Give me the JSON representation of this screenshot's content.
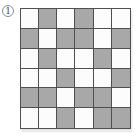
{
  "figure": {
    "option_label": "1",
    "grid": {
      "rows": 6,
      "cols": 6,
      "legend": {
        "1": "shaded",
        "0": "unshaded"
      },
      "pattern": [
        [
          0,
          1,
          0,
          1,
          0,
          0
        ],
        [
          1,
          0,
          1,
          1,
          0,
          1
        ],
        [
          0,
          1,
          0,
          0,
          1,
          0
        ],
        [
          0,
          0,
          1,
          0,
          0,
          1
        ],
        [
          1,
          1,
          0,
          1,
          1,
          0
        ],
        [
          0,
          0,
          1,
          0,
          1,
          1
        ]
      ]
    },
    "colors": {
      "shaded_cell": "#a8a8a8",
      "unshaded_cell": "#fcfcfc",
      "grid_line": "#4f4f4f",
      "background": "#ffffff",
      "label_outline": "#8a8a8a"
    }
  }
}
